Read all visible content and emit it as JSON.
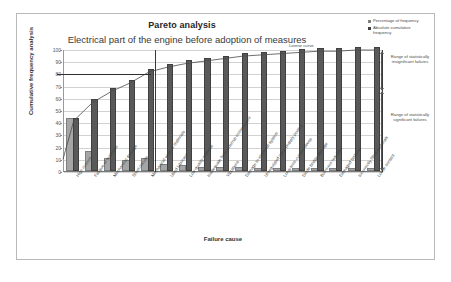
{
  "chart_title": "Pareto analysis",
  "chart_subtitle": "Electrical part of the engine before adoption of measures",
  "legend": [
    {
      "label": "Percentage of frequency",
      "color": "#a6a6a6"
    },
    {
      "label": "Absolute cumulative frequency",
      "color": "#595959"
    }
  ],
  "annotations": {
    "lorenz_label": "Lorenz curve",
    "range_insignificant": "Range of statistically insignificant failures",
    "range_significant": "Range of statistically significant failures"
  },
  "chart_data": {
    "type": "bar",
    "title": "Pareto analysis",
    "subtitle": "Electrical part of the engine before adoption of measures",
    "xlabel": "Failure cause",
    "ylabel": "Cumulative frequency analysis",
    "ylim": [
      0,
      100
    ],
    "yticks": [
      0,
      10,
      20,
      30,
      40,
      50,
      60,
      70,
      80,
      90,
      100
    ],
    "grid": true,
    "legend_position": "top-right",
    "categories": [
      "High current",
      "Fatigue of materials",
      "Mechanical damage",
      "Short circuits",
      "Mechanical wear of materials",
      "Used lubricant",
      "Low-quality material",
      "Inadequate form external environment",
      "Vibrations",
      "Damage to electrical system",
      "Unregulated input (supply power)",
      "Long-term current stress",
      "Diode bridge damage",
      "Burnt-out regulator",
      "Damaged fastener",
      "Incorrectly fitted terminals",
      "Loose contact"
    ],
    "series": [
      {
        "name": "Percentage of frequency",
        "color": "#a6a6a6",
        "values": [
          42,
          15,
          9,
          7,
          9,
          4,
          3,
          2,
          2,
          2,
          1,
          1,
          1,
          1,
          1,
          1,
          1
        ]
      },
      {
        "name": "Absolute cumulative frequency",
        "color": "#595959",
        "values": [
          42,
          57,
          66,
          73,
          82,
          86,
          89,
          91,
          93,
          95,
          96,
          97,
          98,
          99,
          99,
          100,
          100
        ]
      }
    ],
    "lorenz_curve": {
      "name": "Lorenz curve",
      "values": [
        42,
        57,
        66,
        73,
        82,
        86,
        89,
        91,
        93,
        95,
        96,
        97,
        98,
        99,
        99,
        100,
        100
      ]
    },
    "reference_line": {
      "label": "80",
      "value": 80
    },
    "divider_after_category_index": 4
  }
}
